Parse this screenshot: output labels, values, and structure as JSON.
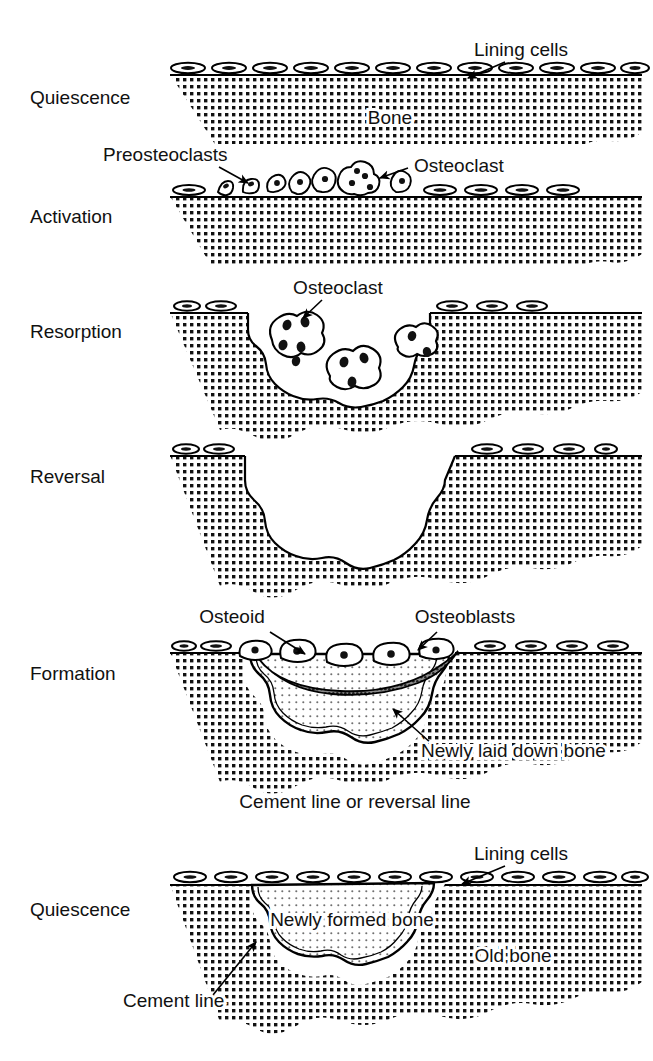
{
  "figure": {
    "background_color": "#ffffff",
    "ink_color": "#000000"
  },
  "colors": {
    "old_bone_fill": "#1a1a1a",
    "new_bone_fill": "#555555",
    "osteoid_fill": "#4a4a4a",
    "cell_fill": "#ffffff",
    "outline": "#000000"
  },
  "stages": [
    {
      "id": "quiescence-top",
      "label": "Quiescence",
      "label_x": 30,
      "label_y": 104,
      "callouts": [
        {
          "name": "lining-cells",
          "text": "Lining cells",
          "x": 521,
          "y": 56,
          "anchor": "middle"
        }
      ],
      "inline_labels": [
        {
          "name": "bone",
          "text": "Bone",
          "x": 390,
          "y": 124,
          "anchor": "middle"
        }
      ]
    },
    {
      "id": "activation",
      "label": "Activation",
      "label_x": 30,
      "label_y": 223,
      "callouts": [
        {
          "name": "preosteoclasts",
          "text": "Preosteoclasts",
          "x": 103,
          "y": 161,
          "anchor": "start"
        },
        {
          "name": "osteoclast",
          "text": "Osteoclast",
          "x": 414,
          "y": 172,
          "anchor": "start"
        }
      ],
      "inline_labels": []
    },
    {
      "id": "resorption",
      "label": "Resorption",
      "label_x": 30,
      "label_y": 338,
      "callouts": [
        {
          "name": "osteoclast",
          "text": "Osteoclast",
          "x": 338,
          "y": 294,
          "anchor": "middle"
        }
      ],
      "inline_labels": []
    },
    {
      "id": "reversal",
      "label": "Reversal",
      "label_x": 30,
      "label_y": 483,
      "callouts": [],
      "inline_labels": []
    },
    {
      "id": "formation",
      "label": "Formation",
      "label_x": 30,
      "label_y": 680,
      "callouts": [
        {
          "name": "osteoid",
          "text": "Osteoid",
          "x": 232,
          "y": 623,
          "anchor": "middle"
        },
        {
          "name": "osteoblasts",
          "text": "Osteoblasts",
          "x": 465,
          "y": 623,
          "anchor": "middle"
        },
        {
          "name": "newly-laid-down-bone",
          "text": "Newly laid down bone",
          "x": 421,
          "y": 757,
          "anchor": "start"
        }
      ],
      "inline_labels": []
    },
    {
      "id": "quiescence-bottom",
      "label": "Quiescence",
      "label_x": 30,
      "label_y": 916,
      "callouts": [
        {
          "name": "lining-cells",
          "text": "Lining cells",
          "x": 521,
          "y": 860,
          "anchor": "middle"
        },
        {
          "name": "cement-line",
          "text": "Cement line",
          "x": 123,
          "y": 1007,
          "anchor": "start"
        }
      ],
      "inline_labels": [
        {
          "name": "newly-formed-bone",
          "text": "Newly formed bone",
          "x": 352,
          "y": 926,
          "anchor": "middle"
        },
        {
          "name": "old-bone",
          "text": "Old bone",
          "x": 513,
          "y": 962,
          "anchor": "middle"
        }
      ]
    }
  ],
  "captions": [
    {
      "name": "cement-line-or-reversal-line",
      "text": "Cement line or reversal line",
      "x": 355,
      "y": 808,
      "anchor": "middle"
    }
  ]
}
